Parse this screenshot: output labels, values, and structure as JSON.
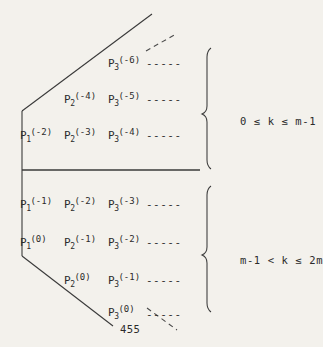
{
  "figure": {
    "page_number": "455",
    "background_color": "#f3f1ec",
    "ink_color": "#2b2b2b"
  },
  "upper_block": {
    "condition": "0 ≤ k ≤ m-1",
    "rows": [
      {
        "terms": [
          {
            "base": "P",
            "sub": "3",
            "sup": "(-6)",
            "x": 108,
            "y": 56
          }
        ],
        "dashes": {
          "text": "-----",
          "x": 146,
          "y": 58
        }
      },
      {
        "terms": [
          {
            "base": "P",
            "sub": "2",
            "sup": "(-4)",
            "x": 64,
            "y": 92
          },
          {
            "base": "P",
            "sub": "3",
            "sup": "(-5)",
            "x": 108,
            "y": 92
          }
        ],
        "dashes": {
          "text": "-----",
          "x": 146,
          "y": 94
        }
      },
      {
        "terms": [
          {
            "base": "P",
            "sub": "1",
            "sup": "(-2)",
            "x": 20,
            "y": 128
          },
          {
            "base": "P",
            "sub": "2",
            "sup": "(-3)",
            "x": 64,
            "y": 128
          },
          {
            "base": "P",
            "sub": "3",
            "sup": "(-4)",
            "x": 108,
            "y": 128
          }
        ],
        "dashes": {
          "text": "-----",
          "x": 146,
          "y": 130
        }
      }
    ]
  },
  "lower_block": {
    "condition": "m-1 < k ≤ 2m",
    "rows": [
      {
        "terms": [
          {
            "base": "P",
            "sub": "1",
            "sup": "(-1)",
            "x": 20,
            "y": 197
          },
          {
            "base": "P",
            "sub": "2",
            "sup": "(-2)",
            "x": 64,
            "y": 197
          },
          {
            "base": "P",
            "sub": "3",
            "sup": "(-3)",
            "x": 108,
            "y": 197
          }
        ],
        "dashes": {
          "text": "-----",
          "x": 146,
          "y": 199
        }
      },
      {
        "terms": [
          {
            "base": "P",
            "sub": "1",
            "sup": "(0)",
            "x": 20,
            "y": 235
          },
          {
            "base": "P",
            "sub": "2",
            "sup": "(-1)",
            "x": 64,
            "y": 235
          },
          {
            "base": "P",
            "sub": "3",
            "sup": "(-2)",
            "x": 108,
            "y": 235
          }
        ],
        "dashes": {
          "text": "-----",
          "x": 146,
          "y": 237
        }
      },
      {
        "terms": [
          {
            "base": "P",
            "sub": "2",
            "sup": "(0)",
            "x": 64,
            "y": 273
          },
          {
            "base": "P",
            "sub": "3",
            "sup": "(-1)",
            "x": 108,
            "y": 273
          }
        ],
        "dashes": {
          "text": "-----",
          "x": 146,
          "y": 275
        }
      },
      {
        "terms": [
          {
            "base": "P",
            "sub": "3",
            "sup": "(0)",
            "x": 108,
            "y": 305
          }
        ],
        "dashes": {
          "text": "-----",
          "x": 146,
          "y": 309
        }
      }
    ]
  }
}
